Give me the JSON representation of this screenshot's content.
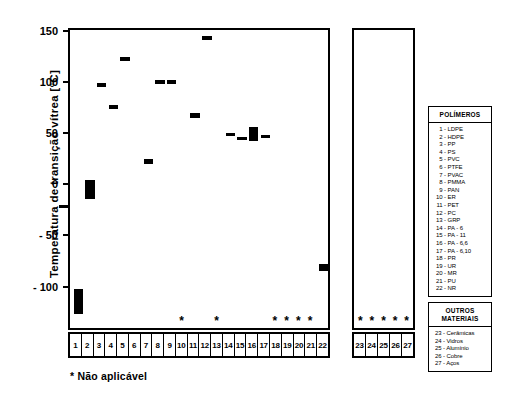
{
  "chart_data": {
    "type": "bar",
    "title": "",
    "subtitle": "",
    "xlabel": "",
    "ylabel": "Temperatura de transição vítrea [°C]",
    "ylim": [
      -140,
      150
    ],
    "yticks": [
      150,
      100,
      50,
      0,
      -50,
      -100
    ],
    "ytick_labels": [
      "150",
      "100",
      "50",
      "0",
      "- 50",
      "- 100"
    ],
    "grid": false,
    "legend_position": "right-outside",
    "notation": "Cada marca representa a faixa de temperatura de transição vítrea (Tg); blocos altos indicam faixa ampla, traços finos indicam valor único.",
    "categories": [
      "1",
      "2",
      "3",
      "4",
      "5",
      "6",
      "7",
      "8",
      "9",
      "10",
      "11",
      "12",
      "13",
      "14",
      "15",
      "16",
      "17",
      "18",
      "19",
      "20",
      "21",
      "22",
      "23",
      "24",
      "25",
      "26",
      "27"
    ],
    "panels": [
      {
        "name": "polimeros",
        "categories": [
          "1",
          "2",
          "3",
          "4",
          "5",
          "6",
          "7",
          "8",
          "9",
          "10",
          "11",
          "12",
          "13",
          "14",
          "15",
          "16",
          "17",
          "18",
          "19",
          "20",
          "21",
          "22"
        ]
      },
      {
        "name": "outros-materiais",
        "categories": [
          "23",
          "24",
          "25",
          "26",
          "27"
        ]
      }
    ],
    "series": [
      {
        "name": "Faixa de Tg",
        "points": [
          {
            "category": "1",
            "material": "LDPE",
            "low": -125,
            "high": -100,
            "value": -112
          },
          {
            "category": "2",
            "material": "HDPE",
            "low": -13,
            "high": 6,
            "value": -4
          },
          {
            "category": "3",
            "material": "PP",
            "low": 97,
            "high": 101,
            "value": 99
          },
          {
            "category": "4",
            "material": "PS",
            "low": 75,
            "high": 79,
            "value": 77
          },
          {
            "category": "5",
            "material": "PVC",
            "low": 122,
            "high": 126,
            "value": 124
          },
          {
            "category": "6",
            "material": "PTFE",
            "low": null,
            "high": null,
            "value": null
          },
          {
            "category": "7",
            "material": "PVAC",
            "low": 22,
            "high": 26,
            "value": 24
          },
          {
            "category": "8",
            "material": "PMMA",
            "low": 100,
            "high": 104,
            "value": 102
          },
          {
            "category": "9",
            "material": "PAN",
            "low": 100,
            "high": 104,
            "value": 102
          },
          {
            "category": "10",
            "material": "ER",
            "low": null,
            "high": null,
            "value": null,
            "not_applicable": true
          },
          {
            "category": "11",
            "material": "PET",
            "low": 67,
            "high": 71,
            "value": 69
          },
          {
            "category": "12",
            "material": "PC",
            "low": 143,
            "high": 147,
            "value": 145
          },
          {
            "category": "13",
            "material": "GRP",
            "low": null,
            "high": null,
            "value": null,
            "not_applicable": true
          },
          {
            "category": "14",
            "material": "PA-6",
            "low": 49,
            "high": 52,
            "value": 50
          },
          {
            "category": "15",
            "material": "PA-11",
            "low": 45,
            "high": 48,
            "value": 47
          },
          {
            "category": "16",
            "material": "PA-6,6",
            "low": 44,
            "high": 58,
            "value": 51
          },
          {
            "category": "17",
            "material": "PA-6,10",
            "low": 47,
            "high": 50,
            "value": 49
          },
          {
            "category": "18",
            "material": "PR",
            "low": null,
            "high": null,
            "value": null,
            "not_applicable": true
          },
          {
            "category": "19",
            "material": "UR",
            "low": null,
            "high": null,
            "value": null,
            "not_applicable": true
          },
          {
            "category": "20",
            "material": "MR",
            "low": null,
            "high": null,
            "value": null,
            "not_applicable": true
          },
          {
            "category": "21",
            "material": "PU",
            "low": null,
            "high": null,
            "value": null,
            "not_applicable": true
          },
          {
            "category": "22",
            "material": "NR",
            "low": -83,
            "high": -76,
            "value": -80
          },
          {
            "category": "23",
            "material": "Cerâmicas",
            "low": null,
            "high": null,
            "value": null,
            "not_applicable": true
          },
          {
            "category": "24",
            "material": "Vidros",
            "low": null,
            "high": null,
            "value": null,
            "not_applicable": true
          },
          {
            "category": "25",
            "material": "Alumínio",
            "low": null,
            "high": null,
            "value": null,
            "not_applicable": true
          },
          {
            "category": "26",
            "material": "Cobre",
            "low": null,
            "high": null,
            "value": null,
            "not_applicable": true
          },
          {
            "category": "27",
            "material": "Aços",
            "low": null,
            "high": null,
            "value": null,
            "not_applicable": true
          }
        ]
      }
    ],
    "not_applicable_categories": [
      "10",
      "13",
      "18",
      "19",
      "20",
      "21",
      "23",
      "24",
      "25",
      "26",
      "27"
    ]
  },
  "axis": {
    "y_label": "Temperatura de transição vítrea [°C]",
    "y_ticks": [
      "150",
      "100",
      "50",
      "0",
      "- 50",
      "- 100"
    ]
  },
  "legend": {
    "polymers": {
      "header": "POLÍMEROS",
      "items": [
        {
          "num": "1 -",
          "label": "LDPE"
        },
        {
          "num": "2 -",
          "label": "HDPE"
        },
        {
          "num": "3 -",
          "label": "PP"
        },
        {
          "num": "4 -",
          "label": "PS"
        },
        {
          "num": "5 -",
          "label": "PVC"
        },
        {
          "num": "6 -",
          "label": "PTFE"
        },
        {
          "num": "7 -",
          "label": "PVAC"
        },
        {
          "num": "8 -",
          "label": "PMMA"
        },
        {
          "num": "9 -",
          "label": "PAN"
        },
        {
          "num": "10 -",
          "label": "ER"
        },
        {
          "num": "11 -",
          "label": "PET"
        },
        {
          "num": "12 -",
          "label": "PC"
        },
        {
          "num": "13 -",
          "label": "GRP"
        },
        {
          "num": "14 -",
          "label": "PA - 6"
        },
        {
          "num": "15 -",
          "label": "PA - 11"
        },
        {
          "num": "16 -",
          "label": "PA - 6,6"
        },
        {
          "num": "17 -",
          "label": "PA - 6,10"
        },
        {
          "num": "18 -",
          "label": "PR"
        },
        {
          "num": "19 -",
          "label": "UR"
        },
        {
          "num": "20 -",
          "label": "MR"
        },
        {
          "num": "21 -",
          "label": "PU"
        },
        {
          "num": "22 -",
          "label": "NR"
        }
      ]
    },
    "others": {
      "header_line1": "OUTROS",
      "header_line2": "MATERIAIS",
      "items": [
        {
          "num": "23 -",
          "label": "Cerâmicas"
        },
        {
          "num": "24 -",
          "label": "Vidros"
        },
        {
          "num": "25 -",
          "label": "Alumínio"
        },
        {
          "num": "26 -",
          "label": "Cobre"
        },
        {
          "num": "27 -",
          "label": "Aços"
        }
      ]
    }
  },
  "footnote": {
    "text": "* Não aplicável",
    "symbol": "*"
  },
  "colors": {
    "mark": "#000000",
    "frame": "#000000",
    "background": "#ffffff"
  }
}
